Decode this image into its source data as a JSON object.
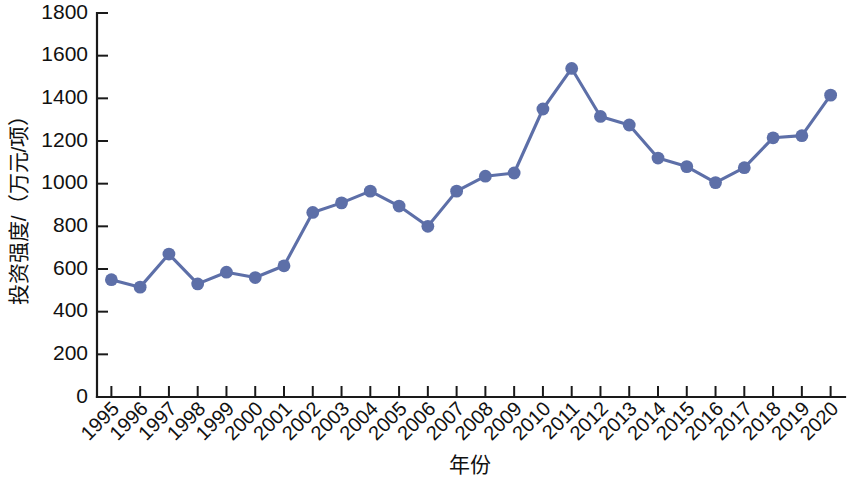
{
  "chart_data": {
    "type": "line",
    "title": "",
    "subtitle": "",
    "xlabel": "年份",
    "ylabel": "投资强度/（万元/项）",
    "categories": [
      "1995",
      "1996",
      "1997",
      "1998",
      "1999",
      "2000",
      "2001",
      "2002",
      "2003",
      "2004",
      "2005",
      "2006",
      "2007",
      "2008",
      "2009",
      "2010",
      "2011",
      "2012",
      "2013",
      "2014",
      "2015",
      "2016",
      "2017",
      "2018",
      "2019",
      "2020"
    ],
    "x": [
      1995,
      1996,
      1997,
      1998,
      1999,
      2000,
      2001,
      2002,
      2003,
      2004,
      2005,
      2006,
      2007,
      2008,
      2009,
      2010,
      2011,
      2012,
      2013,
      2014,
      2015,
      2016,
      2017,
      2018,
      2019,
      2020
    ],
    "values": [
      550,
      515,
      670,
      530,
      585,
      560,
      615,
      865,
      910,
      965,
      895,
      800,
      965,
      1035,
      1050,
      1350,
      1540,
      1315,
      1275,
      1120,
      1080,
      1005,
      1075,
      1215,
      1225,
      1415
    ],
    "series": [
      {
        "name": "投资强度",
        "values": [
          550,
          515,
          670,
          530,
          585,
          560,
          615,
          865,
          910,
          965,
          895,
          800,
          965,
          1035,
          1050,
          1350,
          1540,
          1315,
          1275,
          1120,
          1080,
          1005,
          1075,
          1215,
          1225,
          1415
        ],
        "color": "#5d6fa8",
        "marker": "circle"
      }
    ],
    "ylim": [
      0,
      1800
    ],
    "yticks": [
      0,
      200,
      400,
      600,
      800,
      1000,
      1200,
      1400,
      1600,
      1800
    ],
    "ytick_labels": [
      "0",
      "200",
      "400",
      "600",
      "800",
      "1000",
      "1200",
      "1400",
      "1600",
      "1800"
    ],
    "xtick_labels": [
      "1995",
      "1996",
      "1997",
      "1998",
      "1999",
      "2000",
      "2001",
      "2002",
      "2003",
      "2004",
      "2005",
      "2006",
      "2007",
      "2008",
      "2009",
      "2010",
      "2011",
      "2012",
      "2013",
      "2014",
      "2015",
      "2016",
      "2017",
      "2018",
      "2019",
      "2020"
    ],
    "xtick_rotation": -45,
    "grid": false,
    "legend": false,
    "legend_position": "none",
    "line_color": "#5d6fa8",
    "marker_color": "#5d6fa8",
    "axis_color": "#1a1a1a",
    "background_color": "#ffffff",
    "annotations": []
  }
}
